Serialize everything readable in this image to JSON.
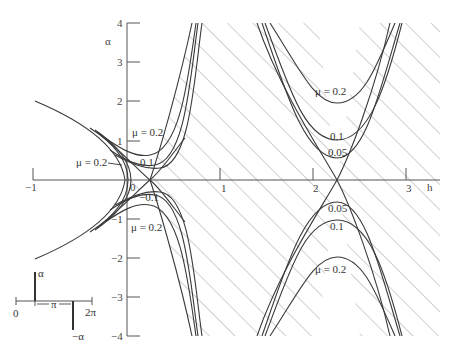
{
  "figure": {
    "type": "stability-chart",
    "x_axis": {
      "label": "h",
      "ticks": [
        {
          "value": -1,
          "label": "−1"
        },
        {
          "value": 0,
          "label": "0"
        },
        {
          "value": 1,
          "label": "1"
        },
        {
          "value": 2,
          "label": "2"
        },
        {
          "value": 3,
          "label": "3"
        }
      ],
      "range": [
        -1,
        3.2
      ]
    },
    "y_axis": {
      "label": "α",
      "ticks": [
        {
          "value": 4,
          "label": "4"
        },
        {
          "value": 3,
          "label": "3"
        },
        {
          "value": 2,
          "label": "2"
        },
        {
          "value": 1,
          "label": "1"
        },
        {
          "value": -1,
          "label": "−1"
        },
        {
          "value": -2,
          "label": "−2"
        },
        {
          "value": -3,
          "label": "−3"
        },
        {
          "value": -4,
          "label": "−4"
        }
      ],
      "range": [
        -4,
        4
      ]
    },
    "curve_labels": {
      "left_upper_mu": "μ = 0.2",
      "left_arrow_mu": "μ = 0.2",
      "left_upper_01": "0.1",
      "left_lower_01": "−0.1",
      "left_lower_mu": "μ = 0.2",
      "right_upper_mu": "μ = 0.2",
      "right_upper_01": "0.1",
      "right_upper_005": "0.05",
      "right_lower_005": "0.05",
      "right_lower_01": "0.1",
      "right_lower_mu": "μ = 0.2"
    },
    "mu_values": [
      0.05,
      0.1,
      0.2
    ],
    "hatched_region": "unstable region between μ = 0 boundaries",
    "inset": {
      "alpha_label": "α",
      "neg_alpha_label": "−α",
      "zero_label": "0",
      "pi_label": "π",
      "two_pi_label": "2π"
    }
  }
}
